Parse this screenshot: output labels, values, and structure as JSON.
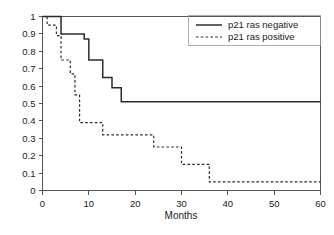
{
  "chart_data": {
    "type": "line",
    "title": "",
    "xlabel": "Months",
    "ylabel": "",
    "xlim": [
      0,
      60
    ],
    "ylim": [
      0,
      1
    ],
    "grid": false,
    "legend_position": "top-right",
    "x_ticks": [
      0,
      10,
      20,
      30,
      40,
      50,
      60
    ],
    "x_tick_labels": [
      "0",
      "10",
      "20",
      "30",
      "40",
      "50",
      "60"
    ],
    "y_ticks": [
      0,
      0.1,
      0.2,
      0.3,
      0.4,
      0.5,
      0.6,
      0.7,
      0.8,
      0.9,
      1
    ],
    "y_tick_labels": [
      "0",
      "0.1",
      "0.2",
      "0.3",
      "0.4",
      "0.5",
      "0.6",
      "0.7",
      "0.8",
      "0.9",
      "1"
    ],
    "step_type": "post",
    "series": [
      {
        "name": "p21 ras negative",
        "style": "solid",
        "color": "#2b2b2b",
        "x": [
          0,
          4,
          9,
          10,
          13,
          15,
          17,
          60
        ],
        "values": [
          1.0,
          0.9,
          0.87,
          0.75,
          0.65,
          0.59,
          0.51,
          0.51
        ]
      },
      {
        "name": "p21 ras positive",
        "style": "dashed",
        "color": "#2b2b2b",
        "x": [
          0,
          1,
          3,
          4,
          6,
          7,
          8,
          13,
          24,
          30,
          36,
          60
        ],
        "values": [
          1.0,
          0.95,
          0.89,
          0.75,
          0.67,
          0.55,
          0.39,
          0.32,
          0.25,
          0.15,
          0.05,
          0.05
        ]
      }
    ]
  },
  "legend": {
    "items": [
      {
        "label": "p21 ras negative",
        "style": "solid"
      },
      {
        "label": "p21 ras positive",
        "style": "dashed"
      }
    ]
  },
  "axis": {
    "x_title": "Months"
  }
}
